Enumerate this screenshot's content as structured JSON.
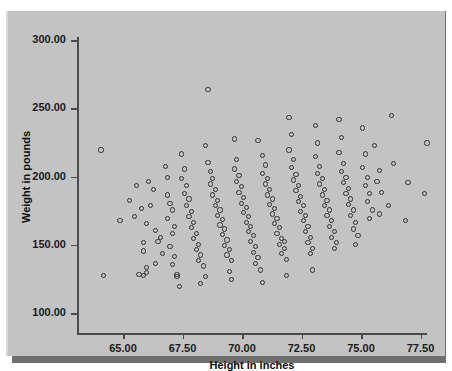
{
  "chart_data": {
    "type": "scatter",
    "title": "",
    "xlabel": "Height in inches",
    "ylabel": "Weight in pounds",
    "xlim": [
      63.2,
      78.5
    ],
    "ylim": [
      92,
      310
    ],
    "xticks": [
      65.0,
      67.5,
      70.0,
      72.5,
      75.0,
      77.5
    ],
    "xtick_labels": [
      "65.00",
      "67.50",
      "70.00",
      "72.50",
      "75.00",
      "77.50"
    ],
    "yticks": [
      100.0,
      150.0,
      200.0,
      250.0,
      300.0
    ],
    "ytick_labels": [
      "100.00",
      "150.00",
      "200.00",
      "250.00",
      "300.00"
    ],
    "grid": false,
    "legend": null,
    "marker": "open-circle",
    "marker_color": "#2e2e2e",
    "plot_background": "#c3c3c3",
    "n_points": 194,
    "points": [
      [
        64.1,
        219
      ],
      [
        64.2,
        127
      ],
      [
        65.6,
        193
      ],
      [
        65.5,
        170
      ],
      [
        65.8,
        176
      ],
      [
        66.0,
        165
      ],
      [
        65.9,
        151
      ],
      [
        65.9,
        145
      ],
      [
        66.0,
        133
      ],
      [
        66.0,
        129
      ],
      [
        65.7,
        128
      ],
      [
        65.9,
        127
      ],
      [
        66.1,
        196
      ],
      [
        66.3,
        190
      ],
      [
        66.2,
        178
      ],
      [
        66.4,
        160
      ],
      [
        66.6,
        155
      ],
      [
        66.5,
        152
      ],
      [
        66.4,
        136
      ],
      [
        66.8,
        207
      ],
      [
        66.9,
        199
      ],
      [
        66.9,
        186
      ],
      [
        67.0,
        180
      ],
      [
        67.1,
        175
      ],
      [
        66.9,
        169
      ],
      [
        67.2,
        163
      ],
      [
        67.1,
        158
      ],
      [
        67.0,
        148
      ],
      [
        67.2,
        141
      ],
      [
        67.1,
        135
      ],
      [
        67.3,
        128
      ],
      [
        67.3,
        126
      ],
      [
        67.5,
        216
      ],
      [
        67.6,
        205
      ],
      [
        67.5,
        198
      ],
      [
        67.7,
        193
      ],
      [
        67.6,
        187
      ],
      [
        67.8,
        183
      ],
      [
        67.7,
        178
      ],
      [
        67.9,
        174
      ],
      [
        67.8,
        170
      ],
      [
        68.0,
        166
      ],
      [
        67.9,
        162
      ],
      [
        68.1,
        158
      ],
      [
        68.0,
        154
      ],
      [
        68.2,
        150
      ],
      [
        68.1,
        146
      ],
      [
        68.3,
        142
      ],
      [
        68.2,
        138
      ],
      [
        68.4,
        134
      ],
      [
        68.3,
        121
      ],
      [
        68.6,
        263
      ],
      [
        68.5,
        222
      ],
      [
        68.6,
        210
      ],
      [
        68.7,
        203
      ],
      [
        68.8,
        198
      ],
      [
        68.7,
        194
      ],
      [
        68.9,
        190
      ],
      [
        68.8,
        186
      ],
      [
        69.0,
        182
      ],
      [
        68.9,
        178
      ],
      [
        69.1,
        175
      ],
      [
        69.0,
        171
      ],
      [
        69.2,
        168
      ],
      [
        69.1,
        164
      ],
      [
        69.3,
        161
      ],
      [
        69.2,
        157
      ],
      [
        69.4,
        153
      ],
      [
        69.3,
        149
      ],
      [
        69.5,
        146
      ],
      [
        69.4,
        142
      ],
      [
        69.6,
        138
      ],
      [
        69.5,
        130
      ],
      [
        69.7,
        227
      ],
      [
        69.8,
        212
      ],
      [
        69.7,
        205
      ],
      [
        69.9,
        200
      ],
      [
        69.8,
        196
      ],
      [
        70.0,
        192
      ],
      [
        69.9,
        188
      ],
      [
        70.1,
        184
      ],
      [
        70.0,
        180
      ],
      [
        70.2,
        177
      ],
      [
        70.1,
        173
      ],
      [
        70.3,
        170
      ],
      [
        70.2,
        166
      ],
      [
        70.4,
        163
      ],
      [
        70.3,
        159
      ],
      [
        70.5,
        156
      ],
      [
        70.4,
        152
      ],
      [
        70.6,
        148
      ],
      [
        70.5,
        144
      ],
      [
        70.7,
        140
      ],
      [
        70.6,
        136
      ],
      [
        70.8,
        131
      ],
      [
        70.7,
        226
      ],
      [
        70.9,
        215
      ],
      [
        71.0,
        208
      ],
      [
        70.9,
        202
      ],
      [
        71.1,
        198
      ],
      [
        71.0,
        194
      ],
      [
        71.2,
        190
      ],
      [
        71.1,
        186
      ],
      [
        71.3,
        183
      ],
      [
        71.2,
        179
      ],
      [
        71.4,
        176
      ],
      [
        71.3,
        172
      ],
      [
        71.5,
        169
      ],
      [
        71.4,
        165
      ],
      [
        71.6,
        162
      ],
      [
        71.5,
        158
      ],
      [
        71.7,
        154
      ],
      [
        71.6,
        150
      ],
      [
        71.8,
        147
      ],
      [
        71.7,
        143
      ],
      [
        71.9,
        139
      ],
      [
        71.8,
        152
      ],
      [
        72.0,
        243
      ],
      [
        72.1,
        230
      ],
      [
        72.0,
        219
      ],
      [
        72.2,
        212
      ],
      [
        72.1,
        206
      ],
      [
        72.3,
        201
      ],
      [
        72.2,
        197
      ],
      [
        72.4,
        193
      ],
      [
        72.3,
        189
      ],
      [
        72.5,
        185
      ],
      [
        72.4,
        181
      ],
      [
        72.6,
        178
      ],
      [
        72.5,
        174
      ],
      [
        72.7,
        171
      ],
      [
        72.6,
        167
      ],
      [
        72.8,
        163
      ],
      [
        72.7,
        159
      ],
      [
        72.9,
        155
      ],
      [
        72.8,
        151
      ],
      [
        73.0,
        147
      ],
      [
        72.9,
        143
      ],
      [
        73.1,
        237
      ],
      [
        73.2,
        224
      ],
      [
        73.1,
        214
      ],
      [
        73.3,
        207
      ],
      [
        73.2,
        202
      ],
      [
        73.4,
        198
      ],
      [
        73.3,
        194
      ],
      [
        73.5,
        190
      ],
      [
        73.4,
        186
      ],
      [
        73.6,
        182
      ],
      [
        73.5,
        178
      ],
      [
        73.7,
        175
      ],
      [
        73.6,
        171
      ],
      [
        73.8,
        167
      ],
      [
        73.7,
        163
      ],
      [
        73.9,
        159
      ],
      [
        73.8,
        155
      ],
      [
        74.0,
        151
      ],
      [
        73.9,
        147
      ],
      [
        74.1,
        241
      ],
      [
        74.2,
        228
      ],
      [
        74.1,
        217
      ],
      [
        74.3,
        209
      ],
      [
        74.2,
        203
      ],
      [
        74.4,
        199
      ],
      [
        74.3,
        195
      ],
      [
        74.5,
        191
      ],
      [
        74.4,
        187
      ],
      [
        74.6,
        183
      ],
      [
        74.5,
        179
      ],
      [
        74.7,
        175
      ],
      [
        74.6,
        171
      ],
      [
        74.8,
        166
      ],
      [
        74.7,
        161
      ],
      [
        74.9,
        156
      ],
      [
        74.8,
        150
      ],
      [
        75.1,
        235
      ],
      [
        75.2,
        216
      ],
      [
        75.1,
        206
      ],
      [
        75.3,
        199
      ],
      [
        75.2,
        193
      ],
      [
        75.4,
        187
      ],
      [
        75.3,
        181
      ],
      [
        75.5,
        175
      ],
      [
        75.4,
        169
      ],
      [
        75.6,
        222
      ],
      [
        75.8,
        204
      ],
      [
        75.7,
        196
      ],
      [
        75.9,
        188
      ],
      [
        75.8,
        172
      ],
      [
        76.3,
        244
      ],
      [
        76.4,
        209
      ],
      [
        76.2,
        178
      ],
      [
        77.0,
        195
      ],
      [
        77.8,
        224
      ],
      [
        77.7,
        187
      ],
      [
        64.9,
        167
      ],
      [
        65.3,
        182
      ],
      [
        66.7,
        143
      ],
      [
        67.4,
        119
      ],
      [
        68.5,
        126
      ],
      [
        69.6,
        124
      ],
      [
        70.9,
        122
      ],
      [
        71.9,
        127
      ],
      [
        73.0,
        131
      ],
      [
        76.9,
        167
      ]
    ]
  },
  "axes": {
    "y_title": "Weight in pounds",
    "x_title": "Height in inches"
  }
}
